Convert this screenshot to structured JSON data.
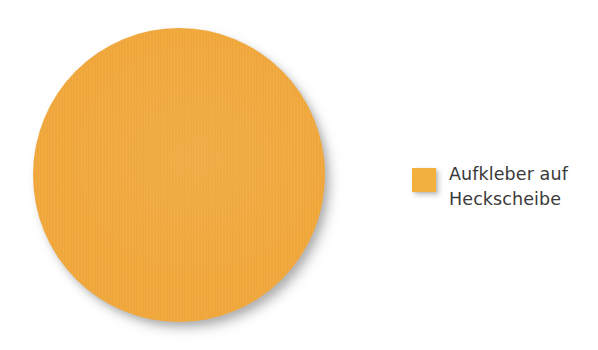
{
  "chart_data": {
    "type": "pie",
    "title": "",
    "subtitle": "",
    "xlabel": "",
    "ylabel": "",
    "grid": false,
    "legend_position": "right",
    "categories": [
      "Aufkleber auf Heckscheibe"
    ],
    "values": [
      100
    ],
    "value_unit": "%",
    "series": [
      {
        "name": "Aufkleber auf Heckscheibe",
        "value": 100,
        "color": "#f2a93c"
      }
    ],
    "annotations": [],
    "data_labels_shown": false
  },
  "figure": {
    "background_color": "#ffffff",
    "slice": {
      "label": "Aufkleber auf Heckscheibe",
      "color": "#f2a93c",
      "percent": 100
    }
  },
  "legend": {
    "items": [
      {
        "label": "Aufkleber auf\nHeckscheibe",
        "label_line_1": "Aufkleber auf",
        "label_line_2": "Heckscheibe",
        "swatch_color": "#f2b13f",
        "text_color": "#3a3a3a"
      }
    ]
  }
}
